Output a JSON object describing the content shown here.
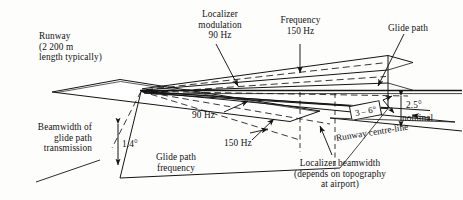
{
  "figure": {
    "background_color": "#fdfdfc",
    "ink_color": "#121212"
  },
  "labels": {
    "runway": "Runway\n(2 200 m\nlength typically)",
    "localizer_modulation": "Localizer\nmodulation\n90 Hz",
    "frequency_150": "Frequency\n150 Hz",
    "glide_path": "Glide path",
    "beamwidth_glide": "Beamwidth of\nglide path\ntransmission",
    "angle_1_4": "1.4°",
    "glide_path_frequency": "Glide path\nfrequency",
    "hz_90": "90 Hz",
    "hz_150": "150 Hz",
    "angle_3_6": "3 – 6°",
    "angle_2_5": "2.5°",
    "nominal": "nominal",
    "runway_centre_line": "Runway centre-line",
    "localizer_beamwidth": "Localizer beamwidth\n(depends on topography\nat airport)"
  }
}
